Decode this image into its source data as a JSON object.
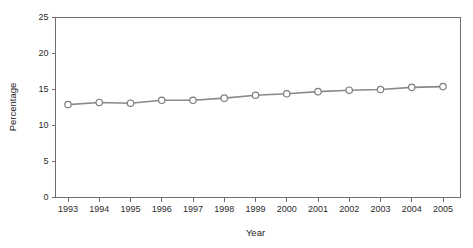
{
  "chart_data": {
    "type": "line",
    "title": "",
    "xlabel": "Year",
    "ylabel": "Percentage",
    "categories": [
      "1993",
      "1994",
      "1995",
      "1996",
      "1997",
      "1998",
      "1999",
      "2000",
      "2001",
      "2002",
      "2003",
      "2004",
      "2005"
    ],
    "values": [
      12.9,
      13.2,
      13.1,
      13.5,
      13.5,
      13.8,
      14.2,
      14.4,
      14.7,
      14.9,
      15.0,
      15.3,
      15.4
    ],
    "series": [
      {
        "name": "Percentage",
        "values": [
          12.9,
          13.2,
          13.1,
          13.5,
          13.5,
          13.8,
          14.2,
          14.4,
          14.7,
          14.9,
          15.0,
          15.3,
          15.4
        ]
      }
    ],
    "ylim": [
      0,
      25
    ],
    "yticks": [
      0,
      5,
      10,
      15,
      20,
      25
    ],
    "ytick_labels": [
      "0",
      "5",
      "10",
      "15",
      "20",
      "25"
    ],
    "xtick_labels": [
      "1993",
      "1994",
      "1995",
      "1996",
      "1997",
      "1998",
      "1999",
      "2000",
      "2001",
      "2002",
      "2003",
      "2004",
      "2005"
    ],
    "grid": false,
    "legend": "none",
    "marker": "open-circle",
    "line_color": "#8a8a8a",
    "marker_fill": "#ffffff",
    "marker_stroke": "#7d7d7d",
    "axis_color": "#6e6e6e",
    "background": "#ffffff"
  },
  "labels": {
    "y_axis_title": "Percentage",
    "x_axis_title": "Year"
  }
}
